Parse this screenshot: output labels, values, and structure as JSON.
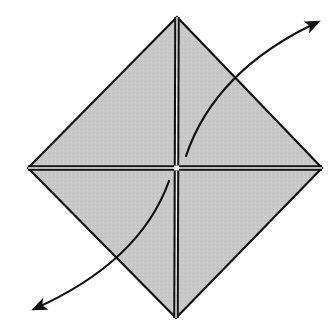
{
  "diagram": {
    "type": "origami-fold",
    "paper": {
      "shape": "diamond",
      "fill": "#c8c8c8",
      "stroke": "#111111",
      "vertices": {
        "top": [
          177,
          17
        ],
        "right": [
          322,
          168
        ],
        "bottom": [
          176,
          318
        ],
        "left": [
          28,
          168
        ]
      }
    },
    "creases": [
      {
        "name": "vertical-crease",
        "from": [
          177,
          17
        ],
        "to": [
          176,
          318
        ],
        "style": "double"
      },
      {
        "name": "horizontal-crease",
        "from": [
          28,
          168
        ],
        "to": [
          322,
          168
        ],
        "style": "double"
      }
    ],
    "arrows": [
      {
        "name": "arrow-up-right",
        "start": [
          186,
          156
        ],
        "control": [
          215,
          70
        ],
        "end": [
          318,
          22
        ]
      },
      {
        "name": "arrow-down-left",
        "start": [
          169,
          181
        ],
        "control": [
          140,
          262
        ],
        "end": [
          34,
          309
        ]
      }
    ],
    "colors": {
      "paper_fill": "#c8c8c8",
      "line": "#111111",
      "crease_highlight": "#f2f2f2",
      "background": "#ffffff"
    }
  }
}
